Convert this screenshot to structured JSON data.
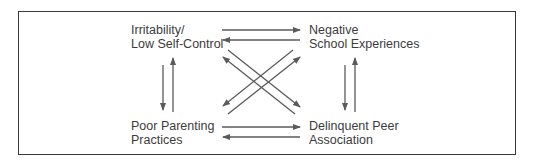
{
  "diagram": {
    "nodes": [
      {
        "id": "irritability",
        "lines": [
          "Irritability/",
          "Low Self-Control"
        ]
      },
      {
        "id": "negative_school",
        "lines": [
          "Negative",
          "School Experiences"
        ]
      },
      {
        "id": "poor_parenting",
        "lines": [
          "Poor Parenting",
          "Practices"
        ]
      },
      {
        "id": "delinquent_peer",
        "lines": [
          "Delinquent Peer",
          "Association"
        ]
      }
    ],
    "edges": [
      {
        "from": "irritability",
        "to": "negative_school"
      },
      {
        "from": "negative_school",
        "to": "irritability"
      },
      {
        "from": "irritability",
        "to": "poor_parenting"
      },
      {
        "from": "poor_parenting",
        "to": "irritability"
      },
      {
        "from": "negative_school",
        "to": "delinquent_peer"
      },
      {
        "from": "delinquent_peer",
        "to": "negative_school"
      },
      {
        "from": "poor_parenting",
        "to": "delinquent_peer"
      },
      {
        "from": "delinquent_peer",
        "to": "poor_parenting"
      },
      {
        "from": "irritability",
        "to": "delinquent_peer"
      },
      {
        "from": "delinquent_peer",
        "to": "irritability"
      },
      {
        "from": "negative_school",
        "to": "poor_parenting"
      },
      {
        "from": "poor_parenting",
        "to": "negative_school"
      }
    ],
    "colors": {
      "border": "#3a3a3a",
      "arrow": "#5a5a5a",
      "text": "#3c3c3c"
    }
  }
}
